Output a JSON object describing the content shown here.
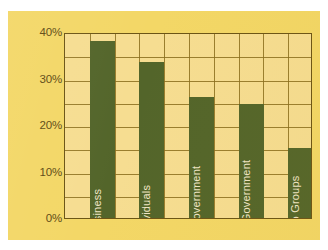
{
  "chart_data": {
    "type": "bar",
    "title": "",
    "subtitle": "",
    "xlabel": "",
    "ylabel": "",
    "categories": [
      "Business",
      "Individuals",
      "State Government",
      "Federal Government",
      "Enviro Groups"
    ],
    "values": [
      38,
      33.5,
      26,
      24.5,
      15
    ],
    "value_unit": "%",
    "ylim": [
      0,
      40
    ],
    "ytick_labels": [
      "0%",
      "10%",
      "20%",
      "30%",
      "40%"
    ],
    "ytick_values": [
      0,
      10,
      20,
      30,
      40
    ],
    "minor_gridline_values": [
      5,
      15,
      25,
      35
    ],
    "grid": "horizontal-and-vertical",
    "legend": "none",
    "series": [
      {
        "name": "Share",
        "values": [
          38,
          33.5,
          26,
          24.5,
          15
        ]
      }
    ],
    "bar_labels_position": "inside-bar-rotated",
    "colors": {
      "panel_background": "#f3d766",
      "plot_background": "#f6dd91",
      "bar_fill": "#53652a",
      "gridline": "#8a6d1c",
      "axis_border": "#6b5415",
      "tick_text": "#5e4a14",
      "bar_label_text": "#f0e6c6",
      "page_background": "#ffffff"
    }
  }
}
